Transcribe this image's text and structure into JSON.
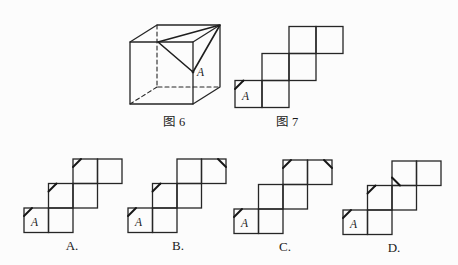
{
  "page": {
    "background": "#fcfcfc",
    "line_color": "#262626",
    "text_color": "#1a1a1a"
  },
  "figure6": {
    "caption": "图 6",
    "vertex_label": "A"
  },
  "figure7": {
    "caption": "图 7",
    "vertex_label": "A",
    "cells": [
      [
        0,
        2
      ],
      [
        1,
        2
      ],
      [
        1,
        1
      ],
      [
        2,
        1
      ],
      [
        2,
        0
      ],
      [
        3,
        0
      ]
    ],
    "marks": [
      {
        "col": 0,
        "row": 2,
        "corner": "tl"
      }
    ]
  },
  "options": [
    {
      "label": "A.",
      "vertex_label": "A",
      "cells": [
        [
          0,
          2
        ],
        [
          1,
          2
        ],
        [
          1,
          1
        ],
        [
          2,
          1
        ],
        [
          2,
          0
        ],
        [
          3,
          0
        ]
      ],
      "marks": [
        {
          "col": 0,
          "row": 2,
          "corner": "tl"
        },
        {
          "col": 1,
          "row": 1,
          "corner": "tl"
        },
        {
          "col": 2,
          "row": 0,
          "corner": "tl"
        }
      ]
    },
    {
      "label": "B.",
      "vertex_label": "A",
      "cells": [
        [
          0,
          2
        ],
        [
          1,
          2
        ],
        [
          1,
          1
        ],
        [
          2,
          1
        ],
        [
          2,
          0
        ],
        [
          3,
          0
        ]
      ],
      "marks": [
        {
          "col": 0,
          "row": 2,
          "corner": "tl"
        },
        {
          "col": 1,
          "row": 1,
          "corner": "tl"
        },
        {
          "col": 3,
          "row": 0,
          "corner": "tr"
        }
      ]
    },
    {
      "label": "C.",
      "vertex_label": "A",
      "cells": [
        [
          0,
          2
        ],
        [
          1,
          2
        ],
        [
          1,
          1
        ],
        [
          2,
          1
        ],
        [
          2,
          0
        ],
        [
          3,
          0
        ]
      ],
      "marks": [
        {
          "col": 0,
          "row": 2,
          "corner": "tl"
        },
        {
          "col": 2,
          "row": 0,
          "corner": "tl"
        },
        {
          "col": 3,
          "row": 0,
          "corner": "tr"
        }
      ]
    },
    {
      "label": "D.",
      "vertex_label": "A",
      "cells": [
        [
          0,
          2
        ],
        [
          1,
          2
        ],
        [
          1,
          1
        ],
        [
          2,
          1
        ],
        [
          2,
          0
        ],
        [
          3,
          0
        ]
      ],
      "marks": [
        {
          "col": 0,
          "row": 2,
          "corner": "tl"
        },
        {
          "col": 1,
          "row": 1,
          "corner": "tl"
        },
        {
          "col": 2,
          "row": 0,
          "corner": "bl"
        }
      ]
    }
  ]
}
